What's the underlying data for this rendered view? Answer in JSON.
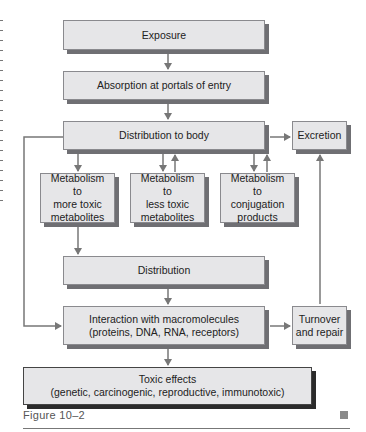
{
  "diagram": {
    "nodes": {
      "exposure": "Exposure",
      "absorption": "Absorption at portals of entry",
      "distribution_to_body": "Distribution to body",
      "excretion": "Excretion",
      "metabolism_more_toxic": [
        "Metabolism",
        "to",
        "more toxic",
        "metabolites"
      ],
      "metabolism_less_toxic": [
        "Metabolism",
        "to",
        "less toxic",
        "metabolites"
      ],
      "metabolism_conjugation": [
        "Metabolism",
        "to",
        "conjugation",
        "products"
      ],
      "distribution": "Distribution",
      "interaction": [
        "Interaction with macromolecules",
        "(proteins, DNA, RNA, receptors)"
      ],
      "turnover": [
        "Turnover",
        "and repair"
      ],
      "toxic_effects": [
        "Toxic effects",
        "(genetic, carcinogenic, reproductive, immunotoxic)"
      ]
    },
    "edges": [
      {
        "from": "Exposure",
        "to": "Absorption at portals of entry"
      },
      {
        "from": "Absorption at portals of entry",
        "to": "Distribution to body"
      },
      {
        "from": "Distribution to body",
        "to": "Excretion"
      },
      {
        "from": "Distribution to body",
        "to": "Metabolism to more toxic metabolites"
      },
      {
        "from": "Distribution to body",
        "to": "Metabolism to less toxic metabolites",
        "bidirectional": true
      },
      {
        "from": "Distribution to body",
        "to": "Metabolism to conjugation products",
        "bidirectional": true
      },
      {
        "from": "Metabolism to more toxic metabolites",
        "to": "Distribution"
      },
      {
        "from": "Distribution",
        "to": "Interaction with macromolecules"
      },
      {
        "from": "Distribution to body",
        "to": "Interaction with macromolecules",
        "route": "left bypass"
      },
      {
        "from": "Interaction with macromolecules",
        "to": "Turnover and repair"
      },
      {
        "from": "Turnover and repair",
        "to": "Excretion"
      },
      {
        "from": "Interaction with macromolecules",
        "to": "Toxic effects"
      }
    ]
  },
  "caption": {
    "label": "Figure 10–2"
  },
  "colors": {
    "box_fill": "#e6e6e8",
    "box_shadow": "#6f6f73",
    "toxic_shadow": "#2b2b2b",
    "arrow": "#777777"
  }
}
